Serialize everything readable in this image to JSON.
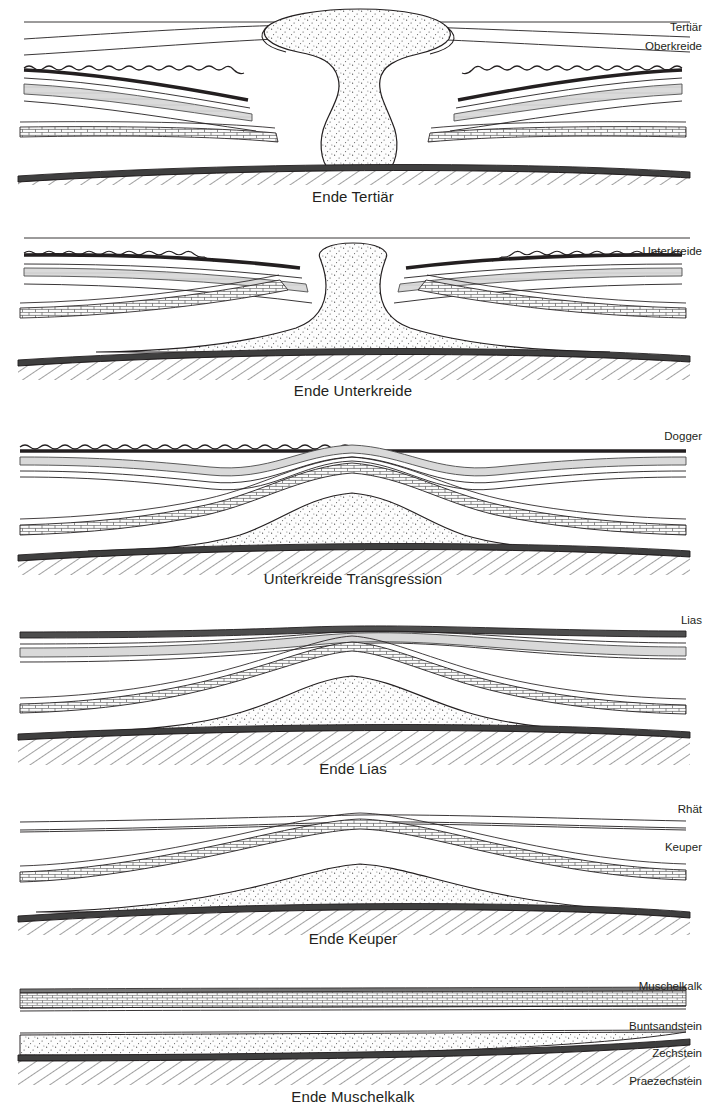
{
  "figure": {
    "title_implicit": "Salzstock-Entwicklung (Salt dome evolution cross-sections)",
    "background": "#ffffff",
    "ink": "#231f20"
  },
  "palette": {
    "ink": "#231f20",
    "salt_fill": "#fdfdfd",
    "salt_speckle": "#4a4a4a",
    "grey_band": "#d9d9d9",
    "dark_band": "#555555",
    "brick_fill": "#fbfbfb",
    "basement_hatch": "#4a4a4a"
  },
  "panels": [
    {
      "id": "panel-ende-tertiaer",
      "caption": "Ende Tertiär",
      "labels": [
        "Tertiär",
        "Oberkreide"
      ],
      "stage_index": 1,
      "salt_shape": "mushroom-diapir",
      "description_implicit": "Vollausgebildeter Salzstock mit Pilzhut, Randsenken beidseits"
    },
    {
      "id": "panel-ende-unterkreide",
      "caption": "Ende Unterkreide",
      "labels": [
        "Unterkreide"
      ],
      "stage_index": 2,
      "salt_shape": "narrow-stock-with-cap",
      "description_implicit": "Salzstock durchbricht Deckschichten, schmaler Hals"
    },
    {
      "id": "panel-unterkreide-transgression",
      "caption": "Unterkreide Transgression",
      "labels": [
        "Dogger"
      ],
      "stage_index": 3,
      "salt_shape": "broad-pillow-high",
      "description_implicit": "Salzkissen stark aufgewölbt, Schichten gebogen"
    },
    {
      "id": "panel-ende-lias",
      "caption": "Ende Lias",
      "labels": [
        "Lias"
      ],
      "stage_index": 4,
      "salt_shape": "pillow-medium",
      "description_implicit": "Salzkissen mäßig aufgewölbt"
    },
    {
      "id": "panel-ende-keuper",
      "caption": "Ende Keuper",
      "labels": [
        "Rhät",
        "Keuper"
      ],
      "stage_index": 5,
      "salt_shape": "pillow-low",
      "description_implicit": "Beginnende Salzkissenbildung"
    },
    {
      "id": "panel-ende-muschelkalk",
      "caption": "Ende Muschelkalk",
      "labels": [
        "Muschelkalk",
        "Buntsandstein",
        "Zechstein",
        "Praezechstein"
      ],
      "stage_index": 6,
      "salt_shape": "flat-layer",
      "description_implicit": "Ungestörte horizontale Schichtlagerung"
    }
  ],
  "stratigraphy": [
    {
      "name": "Tertiär",
      "pattern": "plain"
    },
    {
      "name": "Oberkreide",
      "pattern": "plain"
    },
    {
      "name": "Unterkreide",
      "pattern": "plain"
    },
    {
      "name": "Dogger",
      "pattern": "wavy-dark"
    },
    {
      "name": "Lias",
      "pattern": "dark-band"
    },
    {
      "name": "Rhät",
      "pattern": "thin-pair"
    },
    {
      "name": "Keuper",
      "pattern": "grey-band"
    },
    {
      "name": "Muschelkalk",
      "pattern": "brick"
    },
    {
      "name": "Buntsandstein",
      "pattern": "plain"
    },
    {
      "name": "Zechstein",
      "pattern": "stipple-salt"
    },
    {
      "name": "Praezechstein",
      "pattern": "diagonal-hatch"
    }
  ]
}
